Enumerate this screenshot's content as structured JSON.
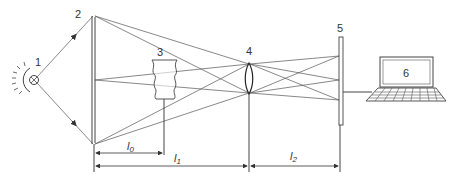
{
  "diagram": {
    "components": [
      {
        "id": "1",
        "label": "1",
        "name": "light-source"
      },
      {
        "id": "2",
        "label": "2",
        "name": "collimating-mirror"
      },
      {
        "id": "3",
        "label": "3",
        "name": "test-object"
      },
      {
        "id": "4",
        "label": "4",
        "name": "lens"
      },
      {
        "id": "5",
        "label": "5",
        "name": "screen-sensor"
      },
      {
        "id": "6",
        "label": "6",
        "name": "laptop-computer"
      }
    ],
    "dimensions": [
      {
        "label": "l",
        "sub": "0",
        "from": "2",
        "to": "3"
      },
      {
        "label": "l",
        "sub": "1",
        "from": "2",
        "to": "4"
      },
      {
        "label": "l",
        "sub": "2",
        "from": "4",
        "to": "5"
      }
    ],
    "colors": {
      "line": "#444444",
      "ray": "#555555",
      "background": "#ffffff"
    }
  }
}
